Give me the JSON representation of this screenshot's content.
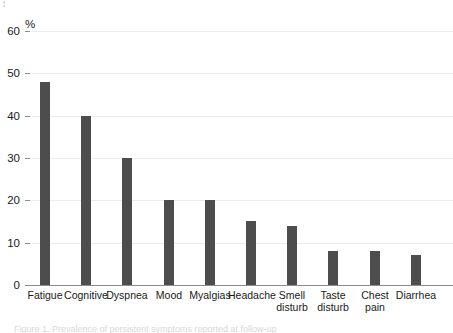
{
  "figure": {
    "top_cut_mark": "¦",
    "bottom_cut_caption": "Figure 1. Prevalence of persistent symptoms reported at follow-up"
  },
  "chart_data": {
    "type": "bar",
    "title": "",
    "xlabel": "",
    "ylabel": "%",
    "ylim": [
      0,
      60
    ],
    "yticks": [
      0,
      10,
      20,
      30,
      40,
      50,
      60
    ],
    "ytick_labels": [
      "0",
      "10",
      "20",
      "30",
      "40",
      "50",
      "60"
    ],
    "grid": true,
    "legend": null,
    "bar_color": "#4d4d4d",
    "gridline_color": "#ececec",
    "axis_color": "#8d8d8d",
    "categories": [
      "Fatigue",
      "Cognitive",
      "Dyspnea",
      "Mood",
      "Myalgias",
      "Headache",
      "Smell\ndisturb",
      "Taste\ndisturb",
      "Chest\npain",
      "Diarrhea"
    ],
    "values": [
      48,
      40,
      30,
      20,
      20,
      15,
      14,
      8,
      8,
      7
    ]
  }
}
